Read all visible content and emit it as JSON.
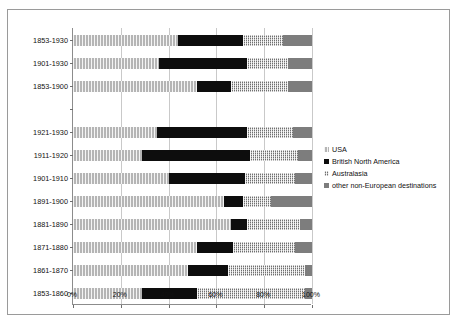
{
  "chart_data": {
    "type": "bar",
    "orientation": "horizontal",
    "stacked": true,
    "normalized": true,
    "title": "",
    "subtitle": "",
    "xlabel": "",
    "ylabel": "",
    "xlim": [
      0,
      100
    ],
    "xticks": [
      "0%",
      "20%",
      "40%",
      "60%",
      "80%",
      "100%"
    ],
    "xtick_values": [
      0,
      20,
      40,
      60,
      80,
      100
    ],
    "grid": true,
    "legend_position": "right",
    "categories": [
      "1853-1930",
      "1901-1930",
      "1853-1900",
      "",
      "1921-1930",
      "1911-1920",
      "1901-1910",
      "1891-1900",
      "1881-1890",
      "1871-1880",
      "1861-1870",
      "1853-1860"
    ],
    "series": [
      {
        "name": "USA",
        "color": "#b5b5b5",
        "pattern": "light-vertical-hatch",
        "values": [
          44,
          36,
          52,
          null,
          35,
          29,
          40,
          63,
          66,
          52,
          48,
          29
        ]
      },
      {
        "name": "British North America",
        "color": "#0d0d0d",
        "pattern": "solid-black",
        "values": [
          27,
          37,
          14,
          null,
          38,
          45,
          32,
          8,
          7,
          15,
          17,
          23
        ]
      },
      {
        "name": "Australasia",
        "color": "#6f6f6f",
        "pattern": "checkerboard",
        "values": [
          17,
          17,
          24,
          null,
          19,
          20,
          21,
          12,
          22,
          26,
          32,
          45
        ]
      },
      {
        "name": "other non-European destinations",
        "color": "#7d7d7d",
        "pattern": "solid-grey",
        "values": [
          12,
          10,
          10,
          null,
          8,
          6,
          7,
          17,
          5,
          7,
          3,
          3
        ]
      }
    ]
  },
  "legend": {
    "items": [
      {
        "label": "USA",
        "color": "#b5b5b5",
        "key_class": "s-usa"
      },
      {
        "label": "British North America",
        "color": "#0d0d0d",
        "key_class": "s-bna"
      },
      {
        "label": "Australasia",
        "color": "#6f6f6f",
        "key_class": "s-aus"
      },
      {
        "label": "other non-European destinations",
        "color": "#7d7d7d",
        "key_class": "s-oth"
      }
    ]
  }
}
